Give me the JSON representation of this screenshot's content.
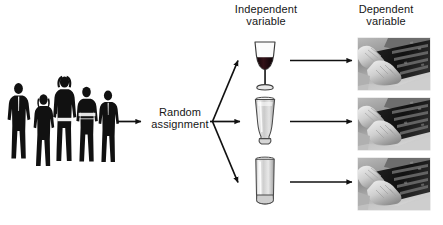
{
  "figure": {
    "type": "experimental-design-flow-diagram",
    "background_color": "#ffffff",
    "line_color": "#111111"
  },
  "headers": {
    "independent": {
      "line1": "Independent",
      "line2": "variable"
    },
    "dependent": {
      "line1": "Dependent",
      "line2": "variable"
    }
  },
  "process": {
    "random_assignment": {
      "line1": "Random",
      "line2": "assignment"
    }
  },
  "participants": {
    "icon": "people-silhouettes-icon",
    "count": 5,
    "color": "#111111"
  },
  "conditions": [
    {
      "id": "wine",
      "icon": "wine-glass-icon",
      "fill_color": "#2a1418",
      "filled": true
    },
    {
      "id": "beer",
      "icon": "pilsner-beer-glass-icon",
      "fill_color": "#c8c8c8",
      "filled": true
    },
    {
      "id": "highball",
      "icon": "highball-glass-icon",
      "fill_color": "#e2e2e2",
      "filled": false
    }
  ],
  "outcomes": [
    {
      "id": "outcome-1",
      "icon": "hands-typing-keyboard-photo"
    },
    {
      "id": "outcome-2",
      "icon": "hands-typing-keyboard-photo"
    },
    {
      "id": "outcome-3",
      "icon": "hands-typing-keyboard-photo"
    }
  ],
  "arrows": [
    {
      "id": "participants-to-assignment",
      "direction": "right"
    },
    {
      "id": "assignment-to-wine",
      "direction": "up-right"
    },
    {
      "id": "assignment-to-beer",
      "direction": "right"
    },
    {
      "id": "assignment-to-highball",
      "direction": "down-right"
    },
    {
      "id": "wine-to-outcome-1",
      "direction": "right"
    },
    {
      "id": "beer-to-outcome-2",
      "direction": "right"
    },
    {
      "id": "highball-to-outcome-3",
      "direction": "right"
    }
  ]
}
